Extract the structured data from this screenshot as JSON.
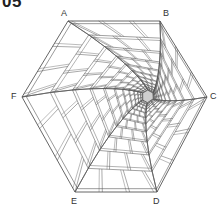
{
  "figure": {
    "number": "05",
    "stroke_color": "#555555",
    "vertices": [
      {
        "label": "A",
        "x": 68,
        "y": 21,
        "lx": 61,
        "ly": 9
      },
      {
        "label": "B",
        "x": 160,
        "y": 21,
        "lx": 163,
        "ly": 9
      },
      {
        "label": "C",
        "x": 207,
        "y": 97,
        "lx": 210,
        "ly": 92
      },
      {
        "label": "D",
        "x": 157,
        "y": 192,
        "lx": 153,
        "ly": 197
      },
      {
        "label": "E",
        "x": 75,
        "y": 192,
        "lx": 71,
        "ly": 197
      },
      {
        "label": "F",
        "x": 22,
        "y": 97,
        "lx": 11,
        "ly": 92
      }
    ],
    "vanishing_point": {
      "x": 150,
      "y": 97
    }
  }
}
